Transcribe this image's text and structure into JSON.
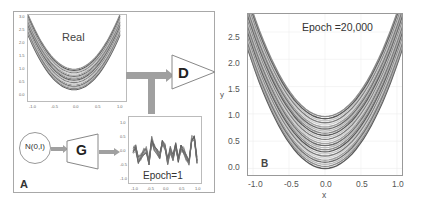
{
  "panel_a": {
    "label": "A",
    "real_plot": {
      "title": "Real",
      "yticks": [
        "3.0",
        "2.5",
        "2.0",
        "1.5",
        "1.0",
        "0.5",
        "0.0"
      ],
      "xticks": [
        "-1.0",
        "-0.5",
        "0.0",
        "0.5",
        "1.0"
      ],
      "xlabel": "x",
      "ylabel": "y"
    },
    "noise_node": "N(0,I)",
    "generator": "G",
    "discriminator": "D",
    "generated_plot": {
      "title": "Epoch=1",
      "yticks": [
        "1.0",
        "0.5",
        "0.0",
        "-0.5",
        "-1.0"
      ],
      "xticks": [
        "-1.0",
        "-0.5",
        "0.0",
        "0.5",
        "1.0"
      ],
      "xlabel": "x"
    }
  },
  "panel_b": {
    "label": "B",
    "title": "Epoch =20,000",
    "yticks": [
      "2.5",
      "2.0",
      "1.5",
      "1.0",
      "0.5",
      "0.0"
    ],
    "xticks": [
      "-1.0",
      "-0.5",
      "0.0",
      "0.5",
      "1.0"
    ],
    "xlabel": "x",
    "ylabel": "y"
  },
  "chart_data": [
    {
      "type": "line",
      "title": "Real",
      "xlabel": "x",
      "ylabel": "y",
      "xlim": [
        -1.0,
        1.0
      ],
      "ylim": [
        0.0,
        3.0
      ],
      "description": "Family of parabolas y = x^2 + c, c in approx [0.2, 1.0]",
      "offsets_range": [
        0.2,
        1.0
      ]
    },
    {
      "type": "line",
      "title": "Epoch=1",
      "xlabel": "x",
      "xlim": [
        -1.0,
        1.0
      ],
      "ylim": [
        -1.2,
        1.2
      ],
      "description": "Noisy generator samples oscillating around 0"
    },
    {
      "type": "line",
      "title": "Epoch =20,000",
      "xlabel": "x",
      "ylabel": "y",
      "xlim": [
        -1.0,
        1.0
      ],
      "ylim": [
        -0.1,
        2.85
      ],
      "description": "Generated parabolas y = 1.9*x^2 + c, c in approx [0.0, 0.95]",
      "offsets_range": [
        0.0,
        0.95
      ]
    }
  ],
  "colors": {
    "arrow": "#a0a0a0",
    "curve_dark": "#555555",
    "curve_light": "#bdbdbd",
    "border": "#a8a8a8"
  }
}
